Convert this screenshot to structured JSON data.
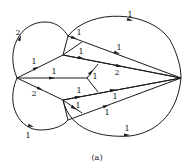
{
  "figure": {
    "caption": "(a)",
    "type": "directed graph with weighted edges"
  },
  "nodes": [
    {
      "id": "L",
      "x": 17,
      "y": 78
    },
    {
      "id": "R",
      "x": 181,
      "y": 78
    },
    {
      "id": "A",
      "x": 63,
      "y": 55
    },
    {
      "id": "B",
      "x": 68,
      "y": 36
    },
    {
      "id": "C",
      "x": 87,
      "y": 78
    },
    {
      "id": "D",
      "x": 63,
      "y": 100
    },
    {
      "id": "E",
      "x": 68,
      "y": 120
    }
  ],
  "edges": [
    {
      "id": "e1",
      "label": "2",
      "path": "M17,78 C5,50 20,22 45,22 C58,22 64,30 68,36",
      "arrow": {
        "x": 20,
        "y": 38,
        "angle": -70
      },
      "label_pos": {
        "x": 18,
        "y": 35
      }
    },
    {
      "id": "e2",
      "label": "1",
      "path": "M68,36 C90,8 150,10 170,40 C178,55 181,68 181,78",
      "arrow": {
        "x": 130,
        "y": 20,
        "angle": 15
      },
      "label_pos": {
        "x": 130,
        "y": 17
      }
    },
    {
      "id": "e3",
      "label": "1",
      "path": "M68,36 L181,78",
      "arrow": {
        "x": 117,
        "y": 53,
        "angle": 20
      },
      "label_pos": {
        "x": 119,
        "y": 50
      }
    },
    {
      "id": "e4",
      "label": "1",
      "path": "M68,36 L63,55",
      "arrow": {
        "x": 74,
        "y": 38,
        "angle": 20
      },
      "label_pos": {
        "x": 79,
        "y": 35
      }
    },
    {
      "id": "e5",
      "label": "1",
      "path": "M17,78 L63,55",
      "arrow": {
        "x": 36,
        "y": 68,
        "angle": -27
      },
      "label_pos": {
        "x": 34,
        "y": 64
      }
    },
    {
      "id": "e6",
      "label": "1",
      "path": "M63,55 L181,78",
      "arrow": {
        "x": 81,
        "y": 58,
        "angle": 11
      },
      "label_pos": {
        "x": 81,
        "y": 54
      }
    },
    {
      "id": "e7",
      "label": "2",
      "path": "M63,55 L181,78",
      "arrow": {
        "x": 119,
        "y": 66,
        "angle": 11
      },
      "label_pos": {
        "x": 117,
        "y": 75
      }
    },
    {
      "id": "e8",
      "label": "",
      "path": "M63,55 L82,42",
      "arrow": null,
      "label_pos": null
    },
    {
      "id": "e9",
      "label": "1",
      "path": "M17,78 L87,78",
      "arrow": {
        "x": 52,
        "y": 78,
        "angle": 0
      },
      "label_pos": {
        "x": 54,
        "y": 74
      }
    },
    {
      "id": "e10",
      "label": "1",
      "path": "M87,78 L98,64",
      "arrow": {
        "x": 91,
        "y": 72,
        "angle": -52
      },
      "label_pos": {
        "x": 95,
        "y": 79
      }
    },
    {
      "id": "e11",
      "label": "",
      "path": "M87,78 L98,92",
      "arrow": null,
      "label_pos": null
    },
    {
      "id": "e12",
      "label": "2",
      "path": "M17,78 L63,100",
      "arrow": {
        "x": 40,
        "y": 89,
        "angle": 26
      },
      "label_pos": {
        "x": 34,
        "y": 96
      }
    },
    {
      "id": "e13",
      "label": "1",
      "path": "M63,100 L181,78",
      "arrow": {
        "x": 78,
        "y": 97,
        "angle": -11
      },
      "label_pos": {
        "x": 79,
        "y": 93
      }
    },
    {
      "id": "e14",
      "label": "1",
      "path": "M63,100 L181,78",
      "arrow": {
        "x": 113,
        "y": 90,
        "angle": -11
      },
      "label_pos": {
        "x": 115,
        "y": 99
      }
    },
    {
      "id": "e15",
      "label": "1",
      "path": "M63,100 L82,113",
      "arrow": {
        "x": 74,
        "y": 108,
        "angle": 34
      },
      "label_pos": {
        "x": 78,
        "y": 108
      }
    },
    {
      "id": "e16",
      "label": "1",
      "path": "M68,120 L181,78",
      "arrow": {
        "x": 106,
        "y": 106,
        "angle": -20
      },
      "label_pos": {
        "x": 107,
        "y": 115
      }
    },
    {
      "id": "e17",
      "label": "1",
      "path": "M17,78 C5,105 20,130 40,130 C55,130 64,125 68,120",
      "arrow": {
        "x": 31,
        "y": 126,
        "angle": 15
      },
      "label_pos": {
        "x": 28,
        "y": 138
      }
    },
    {
      "id": "e18",
      "label": "1",
      "path": "M63,100 C70,130 100,138 130,136 C160,132 178,110 181,78",
      "arrow": {
        "x": 127,
        "y": 135,
        "angle": 0
      },
      "label_pos": {
        "x": 127,
        "y": 131
      }
    },
    {
      "id": "e19",
      "label": "",
      "path": "M63,100 L68,120",
      "arrow": null,
      "label_pos": null
    }
  ]
}
